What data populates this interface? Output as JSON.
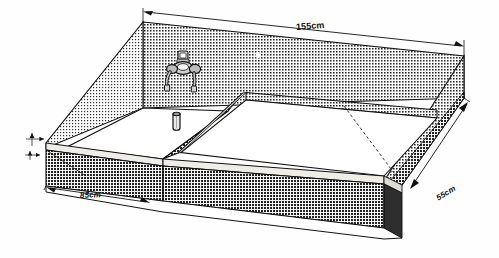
{
  "figure": {
    "background_color": "#fefefe",
    "ink_color": "#111111",
    "shade_color": "#9a9a9a",
    "basin_color": "#ffffff",
    "rim_color": "#e6e4df"
  },
  "dimensions": {
    "width": "155cm",
    "depth_left": "85cm",
    "depth_right": "55cm"
  },
  "fixtures": {
    "tap_name": "mixer-tap",
    "drain_name": "drain-strainer",
    "divider_name": "basin-divider-wall"
  }
}
